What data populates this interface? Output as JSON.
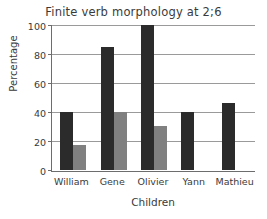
{
  "chart_data": {
    "type": "bar",
    "title": "Finite verb morphology at 2;6",
    "xlabel": "Children",
    "ylabel": "Percentage",
    "categories": [
      "William",
      "Gene",
      "Olivier",
      "Yann",
      "Mathieu"
    ],
    "series": [
      {
        "name": "dark-series",
        "color": "#2b2b2b",
        "values": [
          40,
          85,
          100,
          40,
          46
        ]
      },
      {
        "name": "light-series",
        "color": "#808080",
        "values": [
          17,
          40,
          30,
          0,
          0
        ]
      }
    ],
    "ylim": [
      0,
      100
    ],
    "yticks": [
      0,
      20,
      40,
      60,
      80,
      100
    ],
    "ytick_labels": [
      "0",
      "20",
      "40",
      "60",
      "80",
      "100"
    ],
    "grid": true,
    "legend": false
  }
}
